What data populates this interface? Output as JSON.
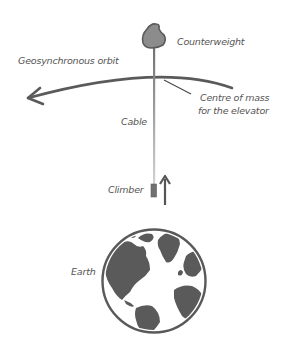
{
  "diagram": {
    "labels": {
      "counterweight": "Counterweight",
      "geo_orbit": "Geosynchronous orbit",
      "centre_of_mass_line1": "Centre of mass",
      "centre_of_mass_line2": "for the elevator",
      "cable": "Cable",
      "climber": "Climber",
      "earth": "Earth"
    },
    "icons": {
      "counterweight": "blob-shape",
      "climber": "rectangle",
      "direction": "up-arrow",
      "earth": "globe-americas-europe-africa",
      "orbit": "curved-arrow-left"
    },
    "colors": {
      "stroke": "#595959",
      "fill": "#595959",
      "counterweight_fill": "#8a8a8a",
      "cable_top": "#777777",
      "cable_bottom": "#d0d0d0",
      "text": "#555555",
      "background": "#ffffff"
    }
  }
}
